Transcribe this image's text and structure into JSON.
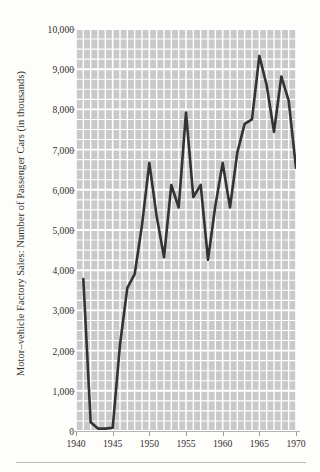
{
  "figure": {
    "background_color": "#fdfdfc",
    "plot_background_color": "#c9c9c9",
    "gridline_color": "#ffffff",
    "line_color": "#333333",
    "text_color": "#333029"
  },
  "axes": {
    "y_axis_title": "Motor–vehicle Factory Sales: Number of Passenger Cars (in thousands)",
    "y_tick_labels": [
      "10,000",
      "9,000",
      "8,000",
      "7,000",
      "6,000",
      "5,000",
      "4,000",
      "3,000",
      "2,000",
      "1,000",
      "0"
    ],
    "y_tick_values": [
      10000,
      9000,
      8000,
      7000,
      6000,
      5000,
      4000,
      3000,
      2000,
      1000,
      0
    ],
    "x_tick_labels": [
      "1940",
      "1945",
      "1950",
      "1955",
      "1960",
      "1965",
      "1970"
    ],
    "x_tick_values": [
      1940,
      1945,
      1950,
      1955,
      1960,
      1965,
      1970
    ]
  },
  "chart_data": {
    "type": "line",
    "title": "",
    "subtitle": "",
    "xlabel": "",
    "ylabel": "Motor–vehicle Factory Sales: Number of Passenger Cars (in thousands)",
    "xlim": [
      1940,
      1970
    ],
    "ylim": [
      0,
      10000
    ],
    "grid": true,
    "legend": false,
    "legend_position": "none",
    "x": [
      1941,
      1942,
      1943,
      1944,
      1945,
      1946,
      1947,
      1948,
      1949,
      1950,
      1951,
      1952,
      1953,
      1954,
      1955,
      1956,
      1957,
      1958,
      1959,
      1960,
      1961,
      1962,
      1963,
      1964,
      1965,
      1966,
      1967,
      1968,
      1969,
      1970
    ],
    "series": [
      {
        "name": "Passenger cars",
        "values": [
          3780,
          220,
          60,
          60,
          80,
          2150,
          3560,
          3900,
          5120,
          6670,
          5340,
          4320,
          6120,
          5560,
          7920,
          5820,
          6120,
          4260,
          5600,
          6670,
          5560,
          6930,
          7640,
          7750,
          9330,
          8600,
          7440,
          8820,
          8220,
          6550
        ]
      }
    ],
    "annotations": [
      {
        "text": "Production halted for World War II",
        "x_range": [
          1942,
          1945
        ]
      },
      {
        "text": "Record peak 1965",
        "x": 1965,
        "y": 9330
      }
    ]
  }
}
